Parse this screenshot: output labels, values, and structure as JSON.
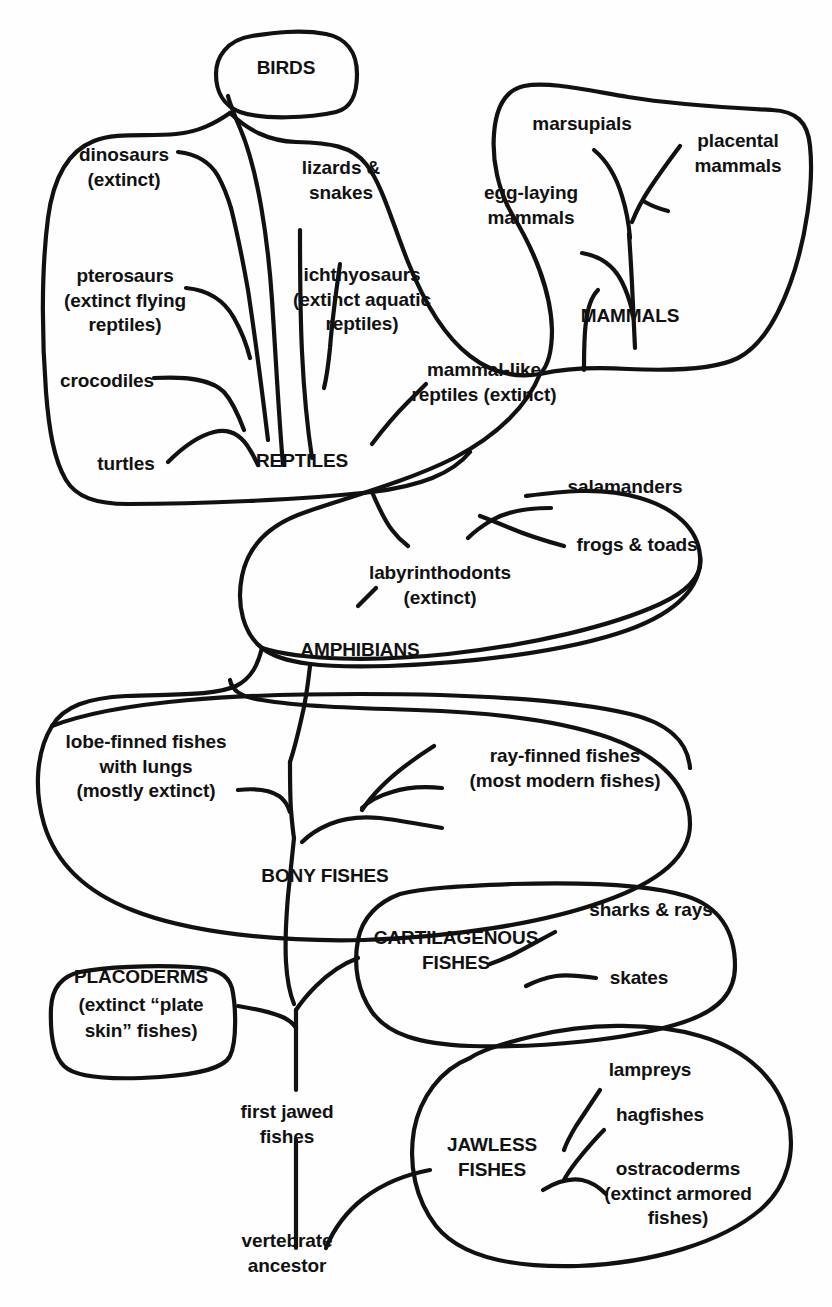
{
  "diagram": {
    "type": "cladogram",
    "ink_color": "#111111",
    "background_color": "#fefefe",
    "groups": [
      {
        "id": "birds",
        "label": "BIRDS",
        "style": "caps",
        "members": []
      },
      {
        "id": "reptiles",
        "label": "REPTILES",
        "style": "caps",
        "members": [
          "dinosaurs\n(extinct)",
          "pterosaurs\n(extinct flying\nreptiles)",
          "crocodiles",
          "turtles",
          "lizards &\nsnakes",
          "ichthyosaurs\n(extinct aquatic\nreptiles)",
          "mammal-like\nreptiles (extinct)"
        ]
      },
      {
        "id": "mammals",
        "label": "MAMMALS",
        "style": "caps",
        "members": [
          "marsupials",
          "placental\nmammals",
          "egg-laying\nmammals"
        ]
      },
      {
        "id": "amphibians",
        "label": "AMPHIBIANS",
        "style": "caps",
        "members": [
          "labyrinthodonts\n(extinct)",
          "salamanders",
          "frogs & toads"
        ]
      },
      {
        "id": "bony-fishes",
        "label": "BONY FISHES",
        "style": "caps",
        "members": [
          "lobe-finned fishes\nwith lungs\n(mostly extinct)",
          "ray-finned fishes\n(most modern fishes)"
        ]
      },
      {
        "id": "placoderms",
        "label": "PLACODERMS",
        "style": "caps",
        "members": [
          "(extinct “plate\nskin” fishes)"
        ]
      },
      {
        "id": "cartilagenous-fishes",
        "label": "CARTILAGENOUS\nFISHES",
        "style": "caps",
        "members": [
          "sharks & rays",
          "skates"
        ]
      },
      {
        "id": "jawless-fishes",
        "label": "JAWLESS\nFISHES",
        "style": "caps",
        "members": [
          "lampreys",
          "hagfishes",
          "ostracoderms\n(extinct armored\nfishes)"
        ]
      }
    ],
    "nodes": [
      "first jawed\nfishes",
      "vertebrate\nancestor"
    ],
    "labels": {
      "birds": "BIRDS",
      "dinosaurs": "dinosaurs\n(extinct)",
      "pterosaurs": "pterosaurs\n(extinct flying\nreptiles)",
      "crocodiles": "crocodiles",
      "turtles": "turtles",
      "lizards_snakes": "lizards &\nsnakes",
      "ichthyosaurs": "ichthyosaurs\n(extinct aquatic\nreptiles)",
      "mammal_like_reptiles": "mammal-like\nreptiles (extinct)",
      "reptiles": "REPTILES",
      "marsupials": "marsupials",
      "placental_mammals": "placental\nmammals",
      "egg_laying_mammals": "egg-laying\nmammals",
      "mammals": "MAMMALS",
      "salamanders": "salamanders",
      "frogs_toads": "frogs & toads",
      "labyrinthodonts": "labyrinthodonts\n(extinct)",
      "amphibians": "AMPHIBIANS",
      "lobe_finned": "lobe-finned fishes\nwith lungs\n(mostly extinct)",
      "ray_finned": "ray-finned fishes\n(most modern fishes)",
      "bony_fishes": "BONY FISHES",
      "sharks_rays": "sharks & rays",
      "skates": "skates",
      "cartilagenous_fishes_l1": "CARTILAGENOUS",
      "cartilagenous_fishes_l2": "FISHES",
      "placoderms_l1": "PLACODERMS",
      "placoderms_l2": "(extinct “plate",
      "placoderms_l3": "skin” fishes)",
      "lampreys": "lampreys",
      "hagfishes": "hagfishes",
      "jawless_fishes_l1": "JAWLESS",
      "jawless_fishes_l2": "FISHES",
      "ostracoderms": "ostracoderms\n(extinct armored\nfishes)",
      "first_jawed_fishes": "first jawed\nfishes",
      "vertebrate_ancestor": "vertebrate\nancestor"
    }
  }
}
